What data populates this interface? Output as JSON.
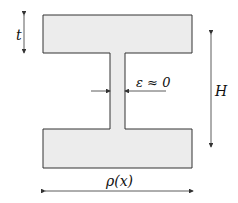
{
  "diagram": {
    "type": "I-beam cross-section",
    "labels": {
      "t": "t",
      "H": "H",
      "epsilon": "ε ≈ 0",
      "rho": "ρ(x)"
    },
    "colors": {
      "fill": "#ececec",
      "stroke": "#333333"
    }
  }
}
